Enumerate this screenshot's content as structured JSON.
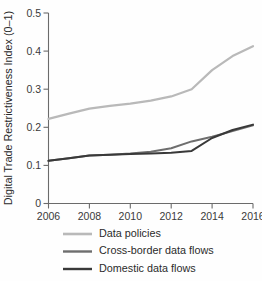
{
  "chart_data": {
    "type": "line",
    "title": "",
    "xlabel": "",
    "ylabel": "Digital Trade Restrictiveness Index (0–1)",
    "x": [
      2006,
      2007,
      2008,
      2009,
      2010,
      2011,
      2012,
      2013,
      2014,
      2015,
      2016
    ],
    "xlim": [
      2006,
      2016
    ],
    "ylim": [
      0,
      0.5
    ],
    "xticks": [
      2006,
      2008,
      2010,
      2012,
      2014,
      2016
    ],
    "xtick_labels": [
      "2006",
      "2008",
      "2010",
      "2012",
      "2014",
      "2016"
    ],
    "yticks": [
      0,
      0.1,
      0.2,
      0.3,
      0.4,
      0.5
    ],
    "ytick_labels": [
      "0",
      "0.1",
      "0.2",
      "0.3",
      "0.4",
      "0.5"
    ],
    "grid": false,
    "legend_position": "below",
    "series": [
      {
        "name": "Data policies",
        "color": "#b9b9b9",
        "width": 2.2,
        "values": [
          0.222,
          0.236,
          0.249,
          0.256,
          0.262,
          0.27,
          0.281,
          0.3,
          0.35,
          0.387,
          0.413
        ]
      },
      {
        "name": "Cross-border data flows",
        "color": "#6e6e6e",
        "width": 2.0,
        "values": [
          0.112,
          0.119,
          0.126,
          0.128,
          0.131,
          0.136,
          0.145,
          0.163,
          0.175,
          0.19,
          0.205
        ]
      },
      {
        "name": "Domestic data flows",
        "color": "#393939",
        "width": 2.0,
        "values": [
          0.112,
          0.119,
          0.126,
          0.128,
          0.13,
          0.131,
          0.133,
          0.138,
          0.172,
          0.193,
          0.207
        ]
      }
    ]
  },
  "legend": {
    "items": [
      {
        "label": "Data policies"
      },
      {
        "label": "Cross-border data flows"
      },
      {
        "label": "Domestic data flows"
      }
    ]
  }
}
